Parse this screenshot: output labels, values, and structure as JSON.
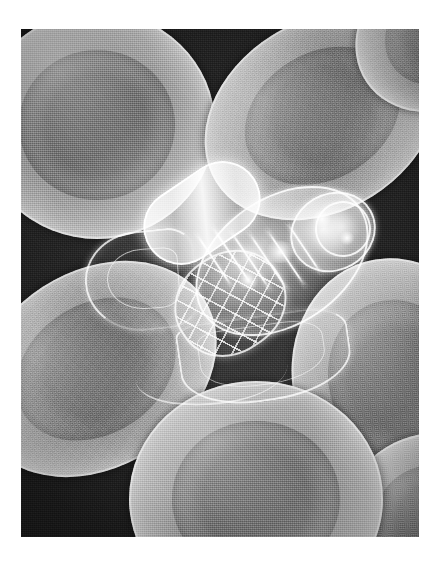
{
  "image": {
    "title": "Nanorobot navigating among red blood cells",
    "medium": "grayscale airbrush / scanning-electron-microscope style illustration",
    "orientation": "portrait",
    "frame": {
      "border_color": "#ffffff",
      "plate_left": 21,
      "plate_top": 29,
      "plate_width": 398,
      "plate_height": 508
    },
    "palette": {
      "background_dark": "#262626",
      "background_darkest": "#1c1c1c",
      "cell_midtone": "#8a8a8a",
      "cell_highlight": "#e8e8e8",
      "cell_dimple": "#6a6a6a",
      "robot_glass": "#ffffff",
      "frame": "#ffffff"
    }
  },
  "subjects": {
    "nanorobot": {
      "label": "nanorobot",
      "description": "transparent glass-like capsule machine with ovoid hull, internal payload chamber, lattice mesh cage, grasping arm and trailing propulsion skirt",
      "position": "center",
      "tilt_degrees": -34,
      "parts": [
        {
          "name": "hull",
          "label": "ovoid outer hull"
        },
        {
          "name": "core",
          "label": "inner payload capsule"
        },
        {
          "name": "nose",
          "label": "forward dome"
        },
        {
          "name": "cap",
          "label": "forward cap ring"
        },
        {
          "name": "cage",
          "label": "rear lattice mesh cage"
        },
        {
          "name": "arm",
          "label": "grasping arm / hook"
        },
        {
          "name": "skirt",
          "label": "lower propulsion skirt"
        },
        {
          "name": "filament",
          "label": "trailing filament"
        }
      ]
    },
    "blood_cells": [
      {
        "id": "cell-top-left",
        "label": "red blood cell, upper left",
        "form": "biconcave disc, face-on",
        "tilt_degrees": 0
      },
      {
        "id": "cell-top-right",
        "label": "red blood cell, upper right",
        "form": "biconcave disc, tilted",
        "tilt_degrees": -32
      },
      {
        "id": "cell-top-corner",
        "label": "red blood cell, top right corner",
        "form": "partial disc at frame edge",
        "tilt_degrees": -34
      },
      {
        "id": "cell-bottom-left",
        "label": "red blood cell, lower left",
        "form": "biconcave disc, tilted",
        "tilt_degrees": -33
      },
      {
        "id": "cell-bottom-mid",
        "label": "red blood cell, bottom center",
        "form": "biconcave disc, face-on",
        "tilt_degrees": 0
      },
      {
        "id": "cell-right",
        "label": "red blood cell, right",
        "form": "biconcave disc, edge-tilted",
        "tilt_degrees": -16
      },
      {
        "id": "cell-right-low",
        "label": "red blood cell, lower right corner",
        "form": "partial disc at frame edge",
        "tilt_degrees": -10
      }
    ],
    "count_visible_cells": 7
  },
  "caption": {
    "alt_text": "A translucent nanorobot drifts among seven grey biconcave red blood cells against a dark grainy plasma background."
  }
}
